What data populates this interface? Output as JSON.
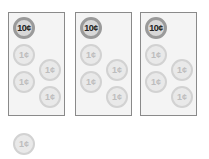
{
  "panels": [
    {
      "coins": [
        {
          "label": "10¢",
          "x": 4,
          "y": 4,
          "type": "c10"
        },
        {
          "label": "1¢",
          "x": 4,
          "y": 31,
          "type": "c1"
        },
        {
          "label": "1¢",
          "x": 30,
          "y": 46,
          "type": "c1"
        },
        {
          "label": "1¢",
          "x": 4,
          "y": 58,
          "type": "c1"
        },
        {
          "label": "1¢",
          "x": 30,
          "y": 73,
          "type": "c1"
        }
      ]
    },
    {
      "coins": [
        {
          "label": "10¢",
          "x": 4,
          "y": 4,
          "type": "c10"
        },
        {
          "label": "1¢",
          "x": 4,
          "y": 31,
          "type": "c1"
        },
        {
          "label": "1¢",
          "x": 30,
          "y": 46,
          "type": "c1"
        },
        {
          "label": "1¢",
          "x": 4,
          "y": 58,
          "type": "c1"
        },
        {
          "label": "1¢",
          "x": 30,
          "y": 73,
          "type": "c1"
        }
      ]
    },
    {
      "coins": [
        {
          "label": "10¢",
          "x": 4,
          "y": 4,
          "type": "c10"
        },
        {
          "label": "1¢",
          "x": 4,
          "y": 31,
          "type": "c1"
        },
        {
          "label": "1¢",
          "x": 30,
          "y": 46,
          "type": "c1"
        },
        {
          "label": "1¢",
          "x": 4,
          "y": 58,
          "type": "c1"
        },
        {
          "label": "1¢",
          "x": 30,
          "y": 73,
          "type": "c1"
        }
      ]
    }
  ],
  "loose_coin": {
    "label": "1¢"
  }
}
